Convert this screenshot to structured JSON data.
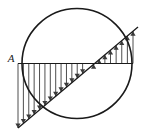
{
  "figure": {
    "background_color": "#ffffff",
    "stroke_color": "#1a1a1a",
    "hatch_color": "#3a3a3a",
    "labels": [
      {
        "name": "point-a-label",
        "text": "A",
        "x": 11,
        "y": 59
      }
    ],
    "circle": {
      "cx": 77,
      "cy": 63.5,
      "r": 55,
      "stroke_width": 1.6
    },
    "axis": {
      "name": "horizontal-axis",
      "x1": 18,
      "y1": 63.5,
      "x2": 133,
      "y2": 63.5,
      "stroke_width": 1.1
    },
    "diagonal": {
      "name": "diagonal-chord",
      "x1": 18,
      "y1": 128,
      "x2": 138,
      "y2": 27,
      "stroke_width": 1.3
    },
    "hatching": {
      "crossing_x": 88,
      "left_count": 13,
      "right_count": 8,
      "arrow_size": 2.6,
      "stroke_width": 0.9,
      "left_arrow_direction": "down",
      "right_arrow_direction": "up"
    }
  },
  "chart_data": {
    "type": "line",
    "xlabel": "",
    "ylabel": "",
    "x": [
      18,
      88,
      138
    ],
    "series": [
      {
        "name": "axis-baseline",
        "values": [
          0,
          0,
          0
        ]
      },
      {
        "name": "diagonal-line",
        "values": [
          -64.5,
          0,
          36.5
        ]
      }
    ],
    "annotations": [
      "A"
    ],
    "legend": "none",
    "grid": false
  }
}
